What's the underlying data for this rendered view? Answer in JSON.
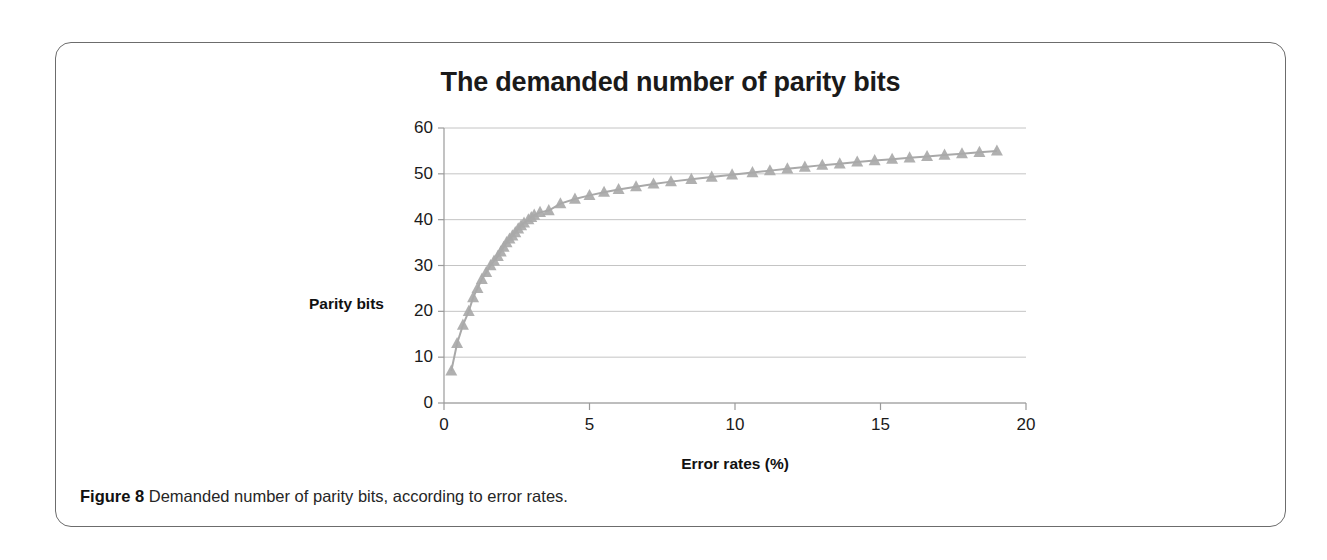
{
  "figure": {
    "caption_label": "Figure 8",
    "caption_text": "Demanded number of parity bits, according to error rates."
  },
  "chart_data": {
    "type": "scatter",
    "title": "The demanded number of parity bits",
    "xlabel": "Error rates (%)",
    "ylabel": "Parity bits",
    "xlim": [
      0,
      20
    ],
    "ylim": [
      0,
      60
    ],
    "xticks": [
      0,
      5,
      10,
      15,
      20
    ],
    "yticks": [
      0,
      10,
      20,
      30,
      40,
      50,
      60
    ],
    "grid": "horizontal",
    "legend": "none",
    "marker": "triangle",
    "marker_color": "#a9a9a9",
    "line_color": "#a9a9a9",
    "series": [
      {
        "name": "Parity bits",
        "x": [
          0.25,
          0.45,
          0.65,
          0.85,
          1.0,
          1.15,
          1.3,
          1.45,
          1.6,
          1.72,
          1.85,
          1.95,
          2.05,
          2.15,
          2.25,
          2.35,
          2.45,
          2.55,
          2.65,
          2.75,
          2.9,
          3.0,
          3.1,
          3.3,
          3.6,
          4.0,
          4.5,
          5.0,
          5.5,
          6.0,
          6.6,
          7.2,
          7.8,
          8.5,
          9.2,
          9.9,
          10.6,
          11.2,
          11.8,
          12.4,
          13.0,
          13.6,
          14.2,
          14.8,
          15.4,
          16.0,
          16.6,
          17.2,
          17.8,
          18.4,
          19.0
        ],
        "y": [
          7,
          13,
          17,
          20,
          23,
          25,
          27,
          28.5,
          30,
          31,
          32,
          33,
          34,
          35,
          35.8,
          36.5,
          37.2,
          38,
          38.7,
          39.3,
          40,
          40.5,
          41,
          41.6,
          42,
          43.5,
          44.5,
          45.3,
          46,
          46.6,
          47.2,
          47.8,
          48.3,
          48.8,
          49.3,
          49.8,
          50.3,
          50.7,
          51.1,
          51.5,
          51.9,
          52.2,
          52.6,
          52.9,
          53.2,
          53.5,
          53.8,
          54.1,
          54.4,
          54.7,
          55
        ]
      }
    ]
  }
}
